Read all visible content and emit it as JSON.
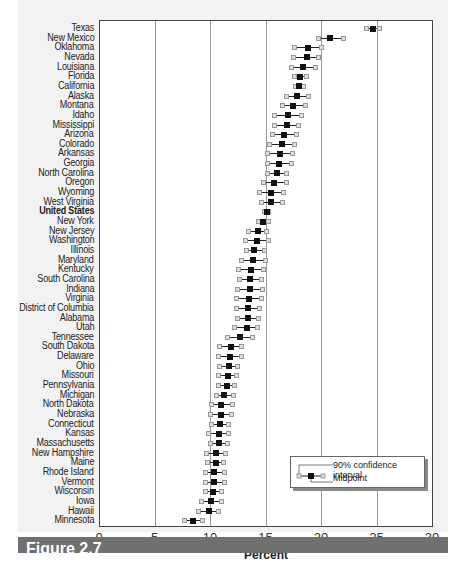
{
  "chart_data": {
    "type": "scatter",
    "subtype": "dot-plot-with-error-bars",
    "title": "",
    "xlabel": "Percent",
    "ylabel": "",
    "xlim": [
      0,
      30
    ],
    "xticks": [
      0,
      5,
      10,
      15,
      20,
      25,
      30
    ],
    "grid": "vertical",
    "legend": {
      "position": "lower right",
      "entries": [
        "90% confidence interval",
        "Midpoint"
      ]
    },
    "categories": [
      "Texas",
      "New Mexico",
      "Oklahoma",
      "Nevada",
      "Louisiana",
      "Florida",
      "California",
      "Alaska",
      "Montana",
      "Idaho",
      "Mississippi",
      "Arizona",
      "Colorado",
      "Arkansas",
      "Georgia",
      "North Carolina",
      "Oregon",
      "Wyoming",
      "West Virginia",
      "United States",
      "New York",
      "New Jersey",
      "Washington",
      "Illinois",
      "Maryland",
      "Kentucky",
      "South Carolina",
      "Indiana",
      "Virginia",
      "District of Columbia",
      "Alabama",
      "Utah",
      "Tennessee",
      "South Dakota",
      "Delaware",
      "Ohio",
      "Missouri",
      "Pennsylvania",
      "Michigan",
      "North Dakota",
      "Nebraska",
      "Connecticut",
      "Kansas",
      "Massachusetts",
      "New Hampshire",
      "Maine",
      "Rhode Island",
      "Vermont",
      "Wisconsin",
      "Iowa",
      "Hawaii",
      "Minnesota"
    ],
    "highlight": "United States",
    "series": [
      {
        "name": "Midpoint",
        "values": [
          24.7,
          20.8,
          18.8,
          18.7,
          18.4,
          18.1,
          18.0,
          17.8,
          17.5,
          17.0,
          16.9,
          16.7,
          16.5,
          16.3,
          16.2,
          16.0,
          15.8,
          15.5,
          15.5,
          15.1,
          14.8,
          14.3,
          14.2,
          14.0,
          13.9,
          13.7,
          13.6,
          13.6,
          13.5,
          13.4,
          13.4,
          13.3,
          12.7,
          11.9,
          11.8,
          11.7,
          11.6,
          11.5,
          11.3,
          11.0,
          11.0,
          10.9,
          10.8,
          10.8,
          10.5,
          10.5,
          10.4,
          10.4,
          10.3,
          10.1,
          9.9,
          8.5
        ]
      },
      {
        "name": "CI Lower",
        "values": [
          24.1,
          19.8,
          17.6,
          17.5,
          17.3,
          17.6,
          17.7,
          16.9,
          16.5,
          15.8,
          15.8,
          15.6,
          15.4,
          15.2,
          15.2,
          15.2,
          14.8,
          14.5,
          14.6,
          14.9,
          14.4,
          13.5,
          13.2,
          13.3,
          12.8,
          12.6,
          12.7,
          12.5,
          12.4,
          12.4,
          12.5,
          12.2,
          11.6,
          10.9,
          10.8,
          10.9,
          10.8,
          10.8,
          10.6,
          10.1,
          10.0,
          10.1,
          9.9,
          10.0,
          9.7,
          9.8,
          9.6,
          9.6,
          9.6,
          9.2,
          9.0,
          7.7
        ]
      },
      {
        "name": "CI Upper",
        "values": [
          25.3,
          22.0,
          20.0,
          19.8,
          19.5,
          18.7,
          18.4,
          18.9,
          18.6,
          18.2,
          18.0,
          17.8,
          17.6,
          17.4,
          17.3,
          16.9,
          16.9,
          16.6,
          16.5,
          15.3,
          15.3,
          15.1,
          15.3,
          14.9,
          15.0,
          14.8,
          14.6,
          14.7,
          14.6,
          14.5,
          14.4,
          14.3,
          13.8,
          12.8,
          12.8,
          12.5,
          12.4,
          12.2,
          12.1,
          12.0,
          11.9,
          11.7,
          11.7,
          11.6,
          11.4,
          11.2,
          11.3,
          11.3,
          11.0,
          11.0,
          10.8,
          9.3
        ]
      }
    ]
  },
  "figure": {
    "caption_label": "Figure 2.7"
  },
  "legend": {
    "ci_label": "90% confidence interval",
    "mid_label": "Midpoint"
  },
  "axis": {
    "xlabel": "Percent"
  },
  "colors": {
    "midpoint": "#111111",
    "ci_cap": "#999999",
    "grid": "#9a9a9a",
    "banner": "#707070"
  }
}
